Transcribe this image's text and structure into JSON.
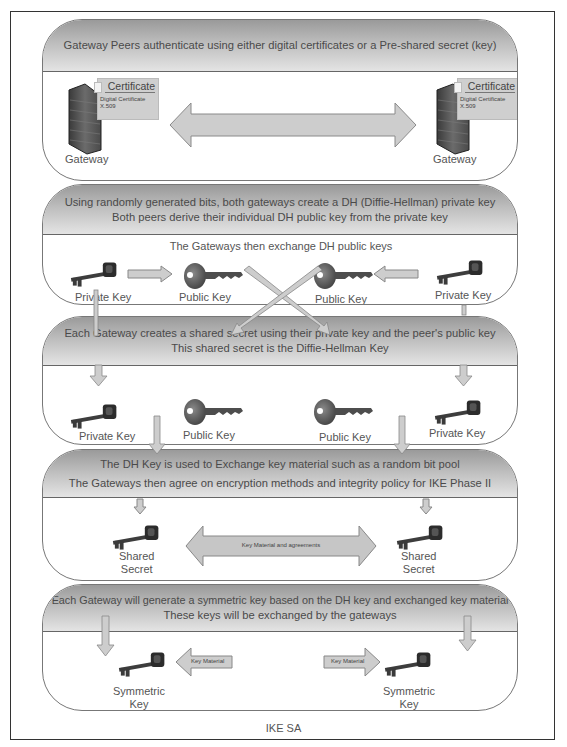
{
  "figure": {
    "caption": "IKE SA",
    "colors": {
      "frame": "#333333",
      "panel_border": "#777777",
      "header_gradient_top": "#9a9a9a",
      "header_gradient_bottom": "#e4e4e4",
      "arrow_fill": "#c8c8c8",
      "arrow_stroke": "#888888",
      "text": "#555555"
    }
  },
  "panels": [
    {
      "header": [
        "Gateway Peers authenticate using either digital certificates or a Pre-shared secret (key)"
      ],
      "left": {
        "label": "Gateway",
        "icon": "firewall-icon",
        "cert_title": "Certificate",
        "cert_sub1": "Digital Certificate",
        "cert_sub2": "X.509"
      },
      "right": {
        "label": "Gateway",
        "icon": "firewall-icon",
        "cert_title": "Certificate",
        "cert_sub1": "Digital Certificate",
        "cert_sub2": "X.509"
      },
      "arrow": "double-arrow"
    },
    {
      "header": [
        "Using randomly generated bits, both gateways create a DH (Diffie-Hellman) private key",
        "Both peers derive their individual DH public key from the private key"
      ],
      "subtitle": "The Gateways then exchange DH public keys",
      "keys": [
        {
          "label": "Private Key",
          "icon": "private-key-icon"
        },
        {
          "label": "Public Key",
          "icon": "public-key-icon"
        },
        {
          "label": "Public Key",
          "icon": "public-key-icon"
        },
        {
          "label": "Private Key",
          "icon": "private-key-icon"
        }
      ]
    },
    {
      "header": [
        "Each Gateway creates a shared secret using their private key and the peer's public key",
        "This shared secret is the Diffie-Hellman Key"
      ],
      "keys": [
        {
          "label": "Private Key",
          "icon": "private-key-icon"
        },
        {
          "label": "Public Key",
          "icon": "public-key-icon"
        },
        {
          "label": "Public Key",
          "icon": "public-key-icon"
        },
        {
          "label": "Private Key",
          "icon": "private-key-icon"
        }
      ]
    },
    {
      "header": [
        "The DH Key is used to Exchange key material such as a random bit pool",
        "The Gateways then agree on encryption methods and integrity policy for IKE Phase II"
      ],
      "left": {
        "label1": "Shared",
        "label2": "Secret"
      },
      "right": {
        "label1": "Shared",
        "label2": "Secret"
      },
      "arrow_label": "Key Material and agreements"
    },
    {
      "header": [
        "Each Gateway will generate a symmetric key based on the DH key and exchanged key material",
        "These keys will be exchanged by the gateways"
      ],
      "left": {
        "label1": "Symmetric",
        "label2": "Key",
        "arrow_label": "Key Material"
      },
      "right": {
        "label1": "Symmetric",
        "label2": "Key",
        "arrow_label": "Key Material"
      }
    }
  ]
}
